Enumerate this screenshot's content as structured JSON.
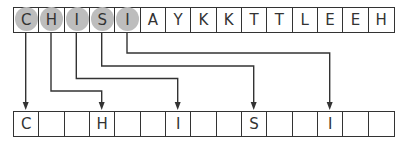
{
  "diagram": {
    "top_row": {
      "cells": [
        "C",
        "H",
        "I",
        "S",
        "I",
        "A",
        "Y",
        "K",
        "K",
        "T",
        "T",
        "L",
        "E",
        "E",
        "H"
      ],
      "highlighted_indices": [
        0,
        1,
        2,
        3,
        4
      ],
      "highlight_color": "#bdbdbd"
    },
    "bottom_row": {
      "cells": [
        "C",
        "",
        "",
        "H",
        "",
        "",
        "I",
        "",
        "",
        "S",
        "",
        "",
        "I",
        "",
        ""
      ]
    },
    "arrows": [
      {
        "from": 0,
        "to": 0,
        "letter": "C"
      },
      {
        "from": 1,
        "to": 3,
        "letter": "H"
      },
      {
        "from": 2,
        "to": 6,
        "letter": "I"
      },
      {
        "from": 3,
        "to": 9,
        "letter": "S"
      },
      {
        "from": 4,
        "to": 12,
        "letter": "I"
      }
    ],
    "line_color": "#333333"
  }
}
